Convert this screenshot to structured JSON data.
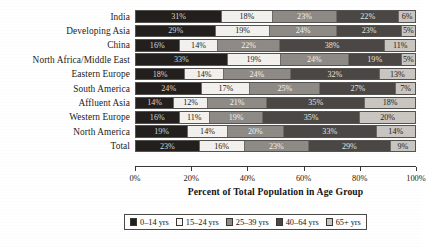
{
  "chart_data": {
    "type": "bar",
    "orientation": "horizontal",
    "stacked": true,
    "normalized_percent": true,
    "title": "",
    "xlabel": "Percent of Total Population in Age Group",
    "ylabel": "",
    "xlim": [
      0,
      100
    ],
    "grid": false,
    "legend_position": "bottom",
    "categories": [
      "India",
      "Developing Asia",
      "China",
      "North Africa/Middle East",
      "Eastern Europe",
      "South America",
      "Affluent Asia",
      "Western Europe",
      "North America",
      "Total"
    ],
    "series": [
      {
        "name": "0–14 yrs",
        "color": "#221f1d",
        "values": [
          31,
          29,
          16,
          33,
          18,
          24,
          14,
          16,
          19,
          23
        ]
      },
      {
        "name": "15–24 yrs",
        "color": "#f2f1ee",
        "values": [
          18,
          19,
          14,
          19,
          14,
          17,
          12,
          11,
          14,
          16
        ]
      },
      {
        "name": "25–39 yrs",
        "color": "#8e8b86",
        "values": [
          23,
          24,
          22,
          24,
          24,
          25,
          21,
          19,
          20,
          23
        ]
      },
      {
        "name": "40–64 yrs",
        "color": "#4a4744",
        "values": [
          22,
          23,
          38,
          19,
          32,
          27,
          35,
          35,
          33,
          29
        ]
      },
      {
        "name": "65+ yrs",
        "color": "#c9c6c1",
        "values": [
          6,
          5,
          11,
          5,
          13,
          7,
          18,
          20,
          14,
          9
        ]
      }
    ],
    "bar_labels": [
      [
        "31%",
        "18%",
        "23%",
        "22%",
        "6%"
      ],
      [
        "29%",
        "19%",
        "24%",
        "23%",
        "5%"
      ],
      [
        "16%",
        "14%",
        "22%",
        "38%",
        "11%"
      ],
      [
        "33%",
        "19%",
        "24%",
        "19%",
        "5%"
      ],
      [
        "18%",
        "14%",
        "24%",
        "32%",
        "13%"
      ],
      [
        "24%",
        "17%",
        "25%",
        "27%",
        "7%"
      ],
      [
        "14%",
        "12%",
        "21%",
        "35%",
        "18%"
      ],
      [
        "16%",
        "11%",
        "19%",
        "35%",
        "20%"
      ],
      [
        "19%",
        "14%",
        "20%",
        "33%",
        "14%"
      ],
      [
        "23%",
        "16%",
        "23%",
        "29%",
        "9%"
      ]
    ],
    "xticks": [
      0,
      20,
      40,
      60,
      80,
      100
    ],
    "xtick_labels": [
      "0%",
      "20%",
      "40%",
      "60%",
      "80%",
      "100%"
    ]
  },
  "axis": {
    "title": "Percent of Total Population in Age Group"
  },
  "legend": {
    "items": [
      {
        "label": "0–14 yrs"
      },
      {
        "label": "15–24 yrs"
      },
      {
        "label": "25–39 yrs"
      },
      {
        "label": "40–64 yrs"
      },
      {
        "label": "65+ yrs"
      }
    ]
  }
}
